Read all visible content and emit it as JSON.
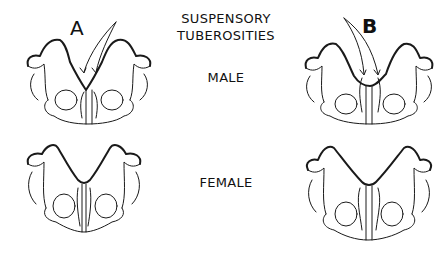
{
  "diagram": {
    "title_line1": "SUSPENSORY",
    "title_line2": "TUBEROSITIES",
    "row_labels": {
      "male": "MALE",
      "female": "FEMALE"
    },
    "column_labels": {
      "a": "A",
      "b": "B"
    },
    "figures": [
      {
        "id": "male-a",
        "description": "male pelvis, specimen A, with two arrows pointing to suspensory tuberosities"
      },
      {
        "id": "male-b",
        "description": "male pelvis, specimen B, with two arrows pointing to suspensory tuberosities"
      },
      {
        "id": "female-a",
        "description": "female pelvis, specimen A"
      },
      {
        "id": "female-b",
        "description": "female pelvis, specimen B"
      }
    ],
    "colors": {
      "ink": "#1a1a1a",
      "background": "#ffffff"
    }
  }
}
